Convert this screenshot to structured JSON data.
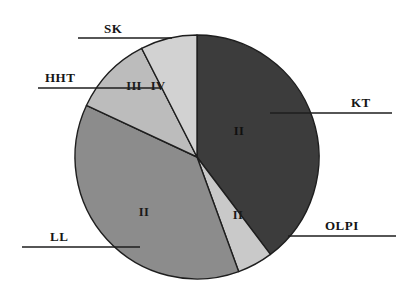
{
  "chart_data": {
    "type": "pie",
    "title": "",
    "subtitle": "",
    "xlabel": "",
    "ylabel": "",
    "legend_position": "callout-labels",
    "grid": false,
    "center": {
      "x": 197,
      "y": 157
    },
    "radius": 122,
    "start_angle_deg": 0,
    "direction": "clockwise",
    "categories": [
      "KT",
      "OLPI",
      "LL",
      "HHT",
      "SK"
    ],
    "values": [
      39.7,
      4.7,
      37.5,
      10.6,
      7.5
    ],
    "slice_inner_labels": [
      "II",
      "II",
      "II",
      "III",
      "IV"
    ],
    "colors": [
      "#3c3c3c",
      "#c9c9c9",
      "#8c8c8c",
      "#bcbcbc",
      "#d2d2d2"
    ],
    "slices": [
      {
        "name": "KT",
        "inner_label": "II",
        "value": 39.7,
        "start_deg": 0,
        "end_deg": 143,
        "color": "#3c3c3c",
        "label_fill": "on-dark",
        "callout_side": "right"
      },
      {
        "name": "OLPI",
        "inner_label": "II",
        "value": 4.7,
        "start_deg": 143,
        "end_deg": 160,
        "color": "#c9c9c9",
        "label_fill": "on-light",
        "callout_side": "right"
      },
      {
        "name": "LL",
        "inner_label": "II",
        "value": 37.5,
        "start_deg": 160,
        "end_deg": 295,
        "color": "#8c8c8c",
        "label_fill": "on-light",
        "callout_side": "left"
      },
      {
        "name": "HHT",
        "inner_label": "III",
        "value": 10.6,
        "start_deg": 295,
        "end_deg": 333,
        "color": "#bcbcbc",
        "label_fill": "on-light",
        "callout_side": "left"
      },
      {
        "name": "SK",
        "inner_label": "IV",
        "value": 7.5,
        "start_deg": 333,
        "end_deg": 360,
        "color": "#d2d2d2",
        "label_fill": "on-light",
        "callout_side": "left"
      }
    ]
  },
  "callouts": {
    "sk": {
      "label": "SK",
      "text_x": 104,
      "text_y": 22,
      "line_x1": 78,
      "line_x2": 172,
      "line_y": 38
    },
    "hht": {
      "label": "HHT",
      "text_x": 45,
      "text_y": 71,
      "line_x1": 38,
      "line_x2": 160,
      "line_y": 88
    },
    "kt": {
      "label": "KT",
      "text_x": 351,
      "text_y": 96,
      "line_x1": 270,
      "line_x2": 392,
      "line_y": 113
    },
    "olpi": {
      "label": "OLPI",
      "text_x": 325,
      "text_y": 219,
      "line_x1": 288,
      "line_x2": 396,
      "line_y": 236
    },
    "ll": {
      "label": "LL",
      "text_x": 50,
      "text_y": 230,
      "line_x1": 22,
      "line_x2": 140,
      "line_y": 247
    }
  },
  "inner_label_positions": {
    "kt_II": {
      "x": 239,
      "y": 132
    },
    "olpi_II": {
      "x": 238,
      "y": 216
    },
    "ll_II": {
      "x": 144,
      "y": 213
    },
    "hht_III": {
      "x": 134,
      "y": 87
    },
    "sk_IV": {
      "x": 158,
      "y": 87
    }
  },
  "colors": {
    "background": "#ffffff",
    "outline": "#1e1e1e",
    "text": "#151515"
  }
}
